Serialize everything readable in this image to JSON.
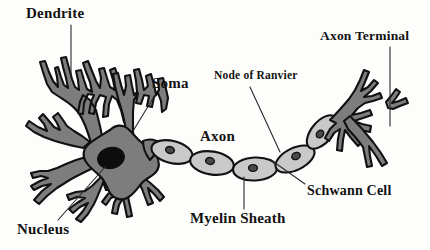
{
  "diagram": {
    "background_color": "#fdfdfc",
    "parts": {
      "dendrite": "Dendrite",
      "soma": "Soma",
      "node_of_ranvier": "Node of Ranvier",
      "axon_terminal": "Axon Terminal",
      "axon": "Axon",
      "nucleus": "Nucleus",
      "myelin_sheath": "Myelin Sheath",
      "schwann_cell": "Schwann Cell"
    },
    "colors": {
      "cell_body_fill": "#7d7d7d",
      "outline": "#111111",
      "nucleus_fill": "#0d0d0d",
      "myelin_fill": "#c9c9c9",
      "schwann_nucleus_fill": "#555555",
      "label_text": "#131313",
      "leader_line": "#2a2a2a"
    }
  }
}
